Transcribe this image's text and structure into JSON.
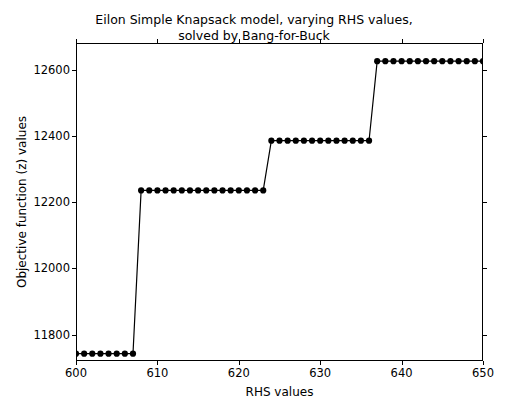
{
  "chart_data": {
    "type": "line",
    "title": "Eilon Simple Knapsack model, varying RHS values,\nsolved by Bang-for-Buck",
    "xlabel": "RHS values",
    "ylabel": "Objective function (z) values",
    "xlim": [
      600,
      650
    ],
    "ylim": [
      11720,
      12680
    ],
    "xticks": [
      600,
      610,
      620,
      630,
      640,
      650
    ],
    "yticks": [
      11800,
      12000,
      12200,
      12400,
      12600
    ],
    "grid": false,
    "legend": null,
    "marker": "circle",
    "line_color": "#000000",
    "marker_color": "#000000",
    "series": [
      {
        "name": "Objective function (z)",
        "x": [
          600,
          601,
          602,
          603,
          604,
          605,
          606,
          607,
          608,
          609,
          610,
          611,
          612,
          613,
          614,
          615,
          616,
          617,
          618,
          619,
          620,
          621,
          622,
          623,
          624,
          625,
          626,
          627,
          628,
          629,
          630,
          631,
          632,
          633,
          634,
          635,
          636,
          637,
          638,
          639,
          640,
          641,
          642,
          643,
          644,
          645,
          646,
          647,
          648,
          649,
          650
        ],
        "values": [
          11742,
          11742,
          11742,
          11742,
          11742,
          11742,
          11742,
          11742,
          12235,
          12235,
          12235,
          12235,
          12235,
          12235,
          12235,
          12235,
          12235,
          12235,
          12235,
          12235,
          12235,
          12235,
          12235,
          12235,
          12385,
          12385,
          12385,
          12385,
          12385,
          12385,
          12385,
          12385,
          12385,
          12385,
          12385,
          12385,
          12385,
          12625,
          12625,
          12625,
          12625,
          12625,
          12625,
          12625,
          12625,
          12625,
          12625,
          12625,
          12625,
          12625,
          12625
        ]
      }
    ],
    "steps": [
      {
        "x_start": 600,
        "x_end": 607,
        "value": 11742
      },
      {
        "x_start": 608,
        "x_end": 623,
        "value": 12235
      },
      {
        "x_start": 624,
        "x_end": 636,
        "value": 12385
      },
      {
        "x_start": 637,
        "x_end": 650,
        "value": 12625
      }
    ]
  }
}
